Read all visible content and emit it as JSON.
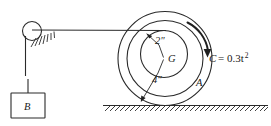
{
  "figure": {
    "labels": {
      "inner_radius": "2\"",
      "outer_radius": "4\"",
      "center": "G",
      "wheel": "A",
      "block": "B",
      "couple_symbol": "C",
      "couple_equation": "= 0.3t",
      "couple_exponent": "2"
    },
    "colors": {
      "line": "#2a2a2a",
      "arrow": "#1f1f1f",
      "background": "#ffffff",
      "text": "#1a1a1a"
    }
  }
}
